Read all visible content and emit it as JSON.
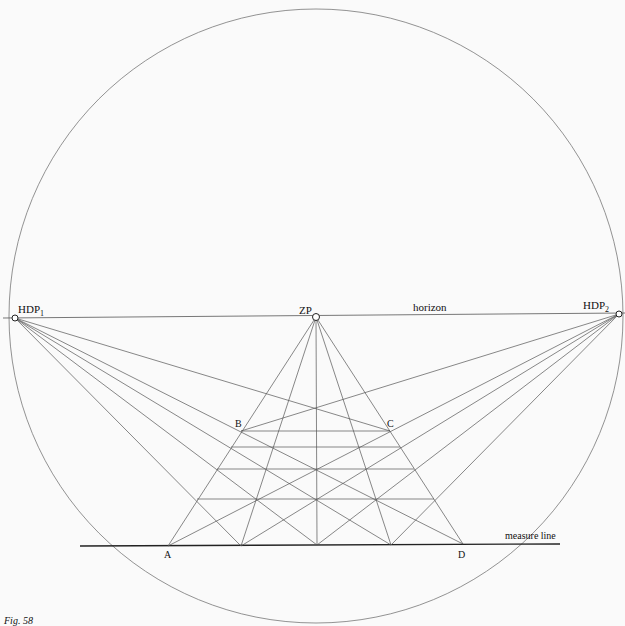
{
  "labels": {
    "hdp1": "HDP",
    "hdp1_sub": "1",
    "hdp2": "HDP",
    "hdp2_sub": "2",
    "zp": "ZP",
    "horizon": "horizon",
    "measure_line": "measure line",
    "a": "A",
    "b": "B",
    "c": "C",
    "d": "D",
    "figure": "Fig. 58"
  },
  "colors": {
    "line": "#555555",
    "ink": "#111111",
    "background": "#fafafa"
  }
}
